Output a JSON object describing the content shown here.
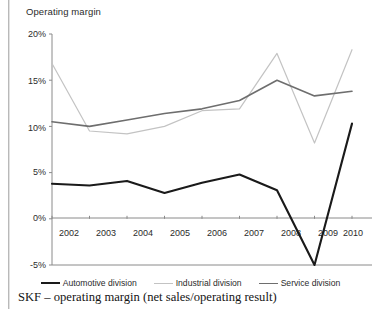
{
  "page": {
    "caption": "SKF – operating margin (net sales/operating result)"
  },
  "chart": {
    "axis_title": "Operating margin",
    "y_ticks": [
      "20%",
      "15%",
      "10%",
      "5%",
      "0%",
      "-5%"
    ],
    "x_ticks": [
      "2002",
      "2003",
      "2004",
      "2005",
      "2006",
      "2007",
      "2008",
      "2009",
      "2010"
    ],
    "legend": [
      {
        "label": "Automotive division",
        "swatch": "automotive",
        "color": "#1a1a1a"
      },
      {
        "label": "Industrial division",
        "swatch": "industrial",
        "color": "#c3c3c3"
      },
      {
        "label": "Service division",
        "swatch": "service",
        "color": "#6e6e6e"
      }
    ]
  },
  "chart_data": {
    "type": "line",
    "title": "SKF – operating margin (net sales/operating result)",
    "xlabel": "",
    "ylabel": "Operating margin",
    "x": [
      2002,
      2003,
      2004,
      2005,
      2006,
      2007,
      2008,
      2009,
      2010
    ],
    "categories": [
      "2002",
      "2003",
      "2004",
      "2005",
      "2006",
      "2007",
      "2008",
      "2009",
      "2010"
    ],
    "ylim": [
      -5,
      20
    ],
    "yticks": [
      -5,
      0,
      5,
      10,
      15,
      20
    ],
    "ytick_labels": [
      "-5%",
      "0%",
      "5%",
      "10%",
      "15%",
      "20%"
    ],
    "grid": false,
    "legend_position": "bottom",
    "units": "percent",
    "series": [
      {
        "name": "Automotive division",
        "color": "#1a1a1a",
        "width": 2.1,
        "values": [
          3.8,
          3.6,
          4.1,
          2.8,
          3.9,
          4.8,
          3.1,
          -5.0,
          10.3
        ]
      },
      {
        "name": "Industrial division",
        "color": "#c3c3c3",
        "width": 1.2,
        "values": [
          16.8,
          9.5,
          9.2,
          10.0,
          11.7,
          11.9,
          17.9,
          8.2,
          18.3
        ]
      },
      {
        "name": "Service division",
        "color": "#6e6e6e",
        "width": 1.6,
        "values": [
          10.5,
          10.0,
          10.7,
          11.4,
          11.9,
          12.8,
          15.0,
          13.3,
          13.8
        ]
      }
    ]
  }
}
